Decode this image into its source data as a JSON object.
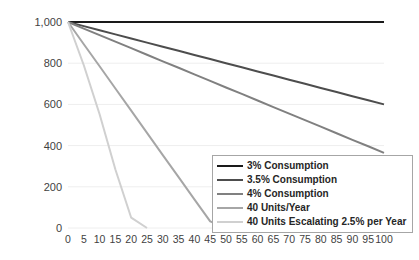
{
  "chart_data": {
    "type": "line",
    "title": "",
    "subtitle": "",
    "xlabel": "",
    "ylabel": "",
    "xlim": [
      0,
      100
    ],
    "ylim": [
      0,
      1000
    ],
    "grid": true,
    "grid_axis": "y",
    "legend_position": "bottom-right",
    "x_ticks": [
      0,
      5,
      10,
      15,
      20,
      25,
      30,
      35,
      40,
      45,
      50,
      55,
      60,
      65,
      70,
      75,
      80,
      85,
      90,
      95,
      100
    ],
    "x_tick_labels": [
      "0",
      "5",
      "10",
      "15",
      "20",
      "25",
      "30",
      "35",
      "40",
      "45",
      "50",
      "55",
      "60",
      "65",
      "70",
      "75",
      "80",
      "85",
      "90",
      "95",
      "100"
    ],
    "y_ticks": [
      0,
      200,
      400,
      600,
      800,
      1000
    ],
    "y_tick_labels": [
      "0",
      "200",
      "400",
      "600",
      "800",
      "1,000"
    ],
    "x": [
      0,
      5,
      10,
      15,
      20,
      25,
      30,
      35,
      40,
      45,
      50,
      55,
      60,
      65,
      70,
      75,
      80,
      85,
      90,
      95,
      100
    ],
    "series": [
      {
        "name": "3% Consumption",
        "color": "#1a1a1a",
        "width": 2.0,
        "values": [
          1000,
          1000,
          1000,
          1000,
          1000,
          1000,
          1000,
          1000,
          1000,
          1000,
          1000,
          1000,
          1000,
          1000,
          1000,
          1000,
          1000,
          1000,
          1000,
          1000,
          1000
        ]
      },
      {
        "name": "3.5% Consumption",
        "color": "#4d4d4d",
        "width": 2.0,
        "values": [
          1000,
          980,
          960,
          940,
          920,
          900,
          880,
          860,
          840,
          820,
          800,
          780,
          760,
          740,
          720,
          700,
          680,
          660,
          640,
          620,
          600
        ]
      },
      {
        "name": "4% Consumption",
        "color": "#808080",
        "width": 2.0,
        "values": [
          1000,
          968,
          936,
          905,
          873,
          841,
          809,
          778,
          746,
          714,
          682,
          651,
          619,
          587,
          555,
          524,
          492,
          460,
          428,
          397,
          365
        ]
      },
      {
        "name": "40 Units/Year",
        "color": "#a6a6a6",
        "width": 2.0,
        "values": [
          1000,
          892,
          785,
          677,
          570,
          462,
          354,
          247,
          139,
          32,
          0,
          0,
          0,
          0,
          0,
          0,
          0,
          0,
          0,
          0,
          0
        ]
      },
      {
        "name": "40 Units Escalating 2.5% per Year",
        "color": "#d0d0d0",
        "width": 2.0,
        "values": [
          1000,
          790,
          552,
          284,
          50,
          0,
          0,
          0,
          0,
          0,
          0,
          0,
          0,
          0,
          0,
          0,
          0,
          0,
          0,
          0,
          0
        ]
      }
    ]
  },
  "legend": {
    "items": [
      {
        "label": "3% Consumption",
        "color": "#1a1a1a"
      },
      {
        "label": "3.5% Consumption",
        "color": "#4d4d4d"
      },
      {
        "label": "4% Consumption",
        "color": "#808080"
      },
      {
        "label": "40 Units/Year",
        "color": "#a6a6a6"
      },
      {
        "label": "40 Units Escalating 2.5% per Year",
        "color": "#d0d0d0"
      }
    ]
  },
  "style": {
    "background": "#ffffff",
    "gridline_color": "#eeeeee",
    "tick_label_color": "#3f3f3f",
    "legend_border_color": "#a6a6a6"
  }
}
